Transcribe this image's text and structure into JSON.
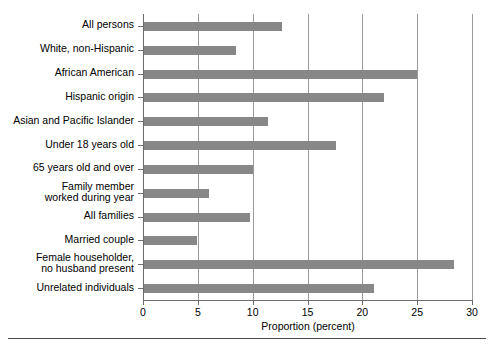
{
  "chart_data": {
    "type": "bar",
    "orientation": "horizontal",
    "title": "",
    "xlabel": "Proportion (percent)",
    "ylabel": "",
    "xlim": [
      0,
      30
    ],
    "xticks": [
      0,
      5,
      10,
      15,
      20,
      25,
      30
    ],
    "grid": true,
    "grid_axis": "x",
    "legend": null,
    "bar_color": "#878787",
    "axis_color": "#6b6b6b",
    "categories": [
      "All persons",
      "White, non-Hispanic",
      "African American",
      "Hispanic origin",
      "Asian and Pacific Islander",
      "Under 18 years old",
      "65 years old and over",
      "Family member\nworked during year",
      "All families",
      "Married couple",
      "Female householder,\nno husband present",
      "Unrelated individuals"
    ],
    "values": [
      12.7,
      8.5,
      25.0,
      22.0,
      11.4,
      17.6,
      10.0,
      6.0,
      9.8,
      4.9,
      28.4,
      21.1
    ]
  }
}
